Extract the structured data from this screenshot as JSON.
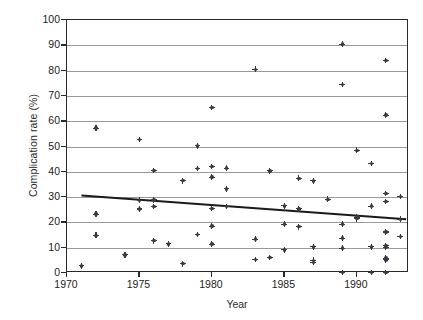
{
  "chart_data": {
    "type": "scatter",
    "title": "",
    "xlabel": "Year",
    "ylabel": "Complication rate (%)",
    "xlim": [
      1970,
      1993.6
    ],
    "ylim": [
      0,
      100
    ],
    "grid": true,
    "legend": null,
    "xticks": [
      1970,
      1975,
      1980,
      1985,
      1990
    ],
    "xtick_labels": [
      "1970",
      "1975",
      "1980",
      "1985",
      "1990"
    ],
    "yticks": [
      0,
      10,
      20,
      30,
      40,
      50,
      60,
      70,
      80,
      90,
      100
    ],
    "ytick_labels": [
      "0",
      "10",
      "20",
      "30",
      "40",
      "50",
      "60",
      "70",
      "80",
      "90",
      "100"
    ],
    "marker": "diamond-dot",
    "marker_color": "#3a3a45",
    "points": [
      {
        "x": 1971,
        "y": 2.8
      },
      {
        "x": 1972,
        "y": 57.2
      },
      {
        "x": 1972,
        "y": 23.3
      },
      {
        "x": 1972,
        "y": 14.9
      },
      {
        "x": 1974,
        "y": 7.2
      },
      {
        "x": 1975,
        "y": 52.8
      },
      {
        "x": 1975,
        "y": 28.7
      },
      {
        "x": 1975,
        "y": 25.3
      },
      {
        "x": 1976,
        "y": 40.5
      },
      {
        "x": 1976,
        "y": 28.9
      },
      {
        "x": 1976,
        "y": 26.3
      },
      {
        "x": 1976,
        "y": 12.8
      },
      {
        "x": 1977,
        "y": 11.5
      },
      {
        "x": 1978,
        "y": 36.5
      },
      {
        "x": 1978,
        "y": 3.7
      },
      {
        "x": 1979,
        "y": 50.3
      },
      {
        "x": 1979,
        "y": 41.3
      },
      {
        "x": 1979,
        "y": 15.2
      },
      {
        "x": 1980,
        "y": 65.4
      },
      {
        "x": 1980,
        "y": 42.1
      },
      {
        "x": 1980,
        "y": 37.9
      },
      {
        "x": 1980,
        "y": 25.5
      },
      {
        "x": 1980,
        "y": 18.5
      },
      {
        "x": 1980,
        "y": 11.4
      },
      {
        "x": 1981,
        "y": 41.4
      },
      {
        "x": 1981,
        "y": 33.3
      },
      {
        "x": 1981,
        "y": 26.3
      },
      {
        "x": 1983,
        "y": 80.5
      },
      {
        "x": 1983,
        "y": 13.4
      },
      {
        "x": 1983,
        "y": 5.3
      },
      {
        "x": 1984,
        "y": 40.4
      },
      {
        "x": 1984,
        "y": 6.1
      },
      {
        "x": 1985,
        "y": 26.5
      },
      {
        "x": 1985,
        "y": 19.3
      },
      {
        "x": 1985,
        "y": 9.2
      },
      {
        "x": 1986,
        "y": 37.4
      },
      {
        "x": 1986,
        "y": 25.4
      },
      {
        "x": 1986,
        "y": 18.3
      },
      {
        "x": 1987,
        "y": 36.4
      },
      {
        "x": 1987,
        "y": 10.3
      },
      {
        "x": 1987,
        "y": 5.0
      },
      {
        "x": 1987,
        "y": 4.2
      },
      {
        "x": 1988,
        "y": 29.1
      },
      {
        "x": 1989,
        "y": 90.4
      },
      {
        "x": 1989,
        "y": 74.5
      },
      {
        "x": 1989,
        "y": 19.3
      },
      {
        "x": 1989,
        "y": 13.8
      },
      {
        "x": 1989,
        "y": 9.8
      },
      {
        "x": 1989,
        "y": 0.2
      },
      {
        "x": 1990,
        "y": 48.5
      },
      {
        "x": 1990,
        "y": 22.1
      },
      {
        "x": 1990,
        "y": 21.5
      },
      {
        "x": 1991,
        "y": 43.3
      },
      {
        "x": 1991,
        "y": 26.4
      },
      {
        "x": 1991,
        "y": 10.3
      },
      {
        "x": 1991,
        "y": 0.2
      },
      {
        "x": 1992,
        "y": 84.0
      },
      {
        "x": 1992,
        "y": 62.4
      },
      {
        "x": 1992,
        "y": 31.4
      },
      {
        "x": 1992,
        "y": 28.3
      },
      {
        "x": 1992,
        "y": 16.2
      },
      {
        "x": 1992,
        "y": 10.9
      },
      {
        "x": 1992,
        "y": 10.2
      },
      {
        "x": 1992,
        "y": 5.9
      },
      {
        "x": 1992,
        "y": 5.2
      },
      {
        "x": 1992,
        "y": 0.2
      },
      {
        "x": 1993,
        "y": 30.2
      },
      {
        "x": 1993,
        "y": 21.2
      },
      {
        "x": 1993,
        "y": 14.4
      }
    ],
    "trendline": {
      "label": "linear fit",
      "color": "#1a1a1a",
      "x_start": 1971.0,
      "y_start": 30.6,
      "x_end": 1993.4,
      "y_end": 21.2
    }
  }
}
